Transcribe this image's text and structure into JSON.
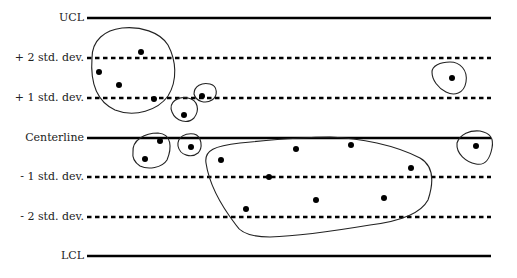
{
  "chart_data": {
    "type": "scatter",
    "title": "",
    "xlabel": "",
    "ylabel": "",
    "grid": false,
    "legend": null,
    "control_lines": [
      {
        "label": "UCL",
        "y": 18,
        "style": "solid"
      },
      {
        "label": "+ 2 std. dev.",
        "y": 58,
        "style": "dashed"
      },
      {
        "label": "+ 1 std. dev.",
        "y": 98,
        "style": "dashed"
      },
      {
        "label": "Centerline",
        "y": 138,
        "style": "solid"
      },
      {
        "label": "- 1 std. dev.",
        "y": 177,
        "style": "dashed"
      },
      {
        "label": "- 2 std. dev.",
        "y": 217,
        "style": "dashed"
      },
      {
        "label": "LCL",
        "y": 256,
        "style": "solid"
      }
    ],
    "line_x_start": 87,
    "line_x_end": 491,
    "points": [
      {
        "x": 141,
        "y": 52
      },
      {
        "x": 99,
        "y": 72
      },
      {
        "x": 119,
        "y": 85
      },
      {
        "x": 154,
        "y": 99
      },
      {
        "x": 184,
        "y": 115
      },
      {
        "x": 202,
        "y": 96
      },
      {
        "x": 160,
        "y": 141
      },
      {
        "x": 145,
        "y": 159
      },
      {
        "x": 191,
        "y": 147
      },
      {
        "x": 221,
        "y": 160
      },
      {
        "x": 296,
        "y": 149
      },
      {
        "x": 351,
        "y": 145
      },
      {
        "x": 411,
        "y": 168
      },
      {
        "x": 269,
        "y": 177
      },
      {
        "x": 246,
        "y": 209
      },
      {
        "x": 316,
        "y": 200
      },
      {
        "x": 384,
        "y": 198
      },
      {
        "x": 452,
        "y": 78
      },
      {
        "x": 476,
        "y": 146
      }
    ],
    "clusters": [
      {
        "name": "upper-left-group",
        "path": "M92,58 C92,40 105,30 122,28 C140,26 160,32 168,45 C176,60 178,80 168,96 C158,110 135,118 115,110 C98,102 90,85 92,58 Z"
      },
      {
        "name": "small-group-below-plus1",
        "path": "M172,112 C168,102 178,96 188,98 C198,100 200,110 194,118 C188,124 176,122 172,112 Z"
      },
      {
        "name": "small-group-on-plus1",
        "path": "M194,94 C194,86 202,82 210,84 C218,86 218,96 212,100 C206,104 196,102 194,94 Z"
      },
      {
        "name": "group-at-centerline",
        "path": "M133,152 C132,140 145,133 158,133 C172,134 172,148 167,160 C162,168 148,170 140,166 C134,162 132,158 133,152 Z"
      },
      {
        "name": "small-group-at-centerline",
        "path": "M178,146 C177,136 186,133 194,134 C202,136 203,148 198,153 C192,158 180,156 178,146 Z"
      },
      {
        "name": "large-lower-group",
        "path": "M206,163 C204,150 215,146 240,143 C270,140 305,137 330,137 C360,138 395,145 420,158 C434,166 434,182 428,200 C420,215 395,222 370,225 C340,230 300,236 270,237 C250,237 240,232 236,225 C226,212 210,190 206,163 Z"
      },
      {
        "name": "right-single-upper",
        "path": "M432,72 C432,66 440,62 450,62 C460,62 468,70 466,82 C464,94 454,96 446,92 C438,88 432,80 432,72 Z"
      },
      {
        "name": "right-single-center",
        "path": "M457,143 C460,134 470,130 480,131 C490,133 494,138 492,148 C490,158 486,166 476,164 C466,162 456,154 457,143 Z"
      }
    ]
  },
  "labels": {
    "ucl": "UCL",
    "plus2": "+ 2 std. dev.",
    "plus1": "+ 1 std. dev.",
    "centerline": "Centerline",
    "minus1": "- 1 std. dev.",
    "minus2": "- 2 std. dev.",
    "lcl": "LCL"
  }
}
